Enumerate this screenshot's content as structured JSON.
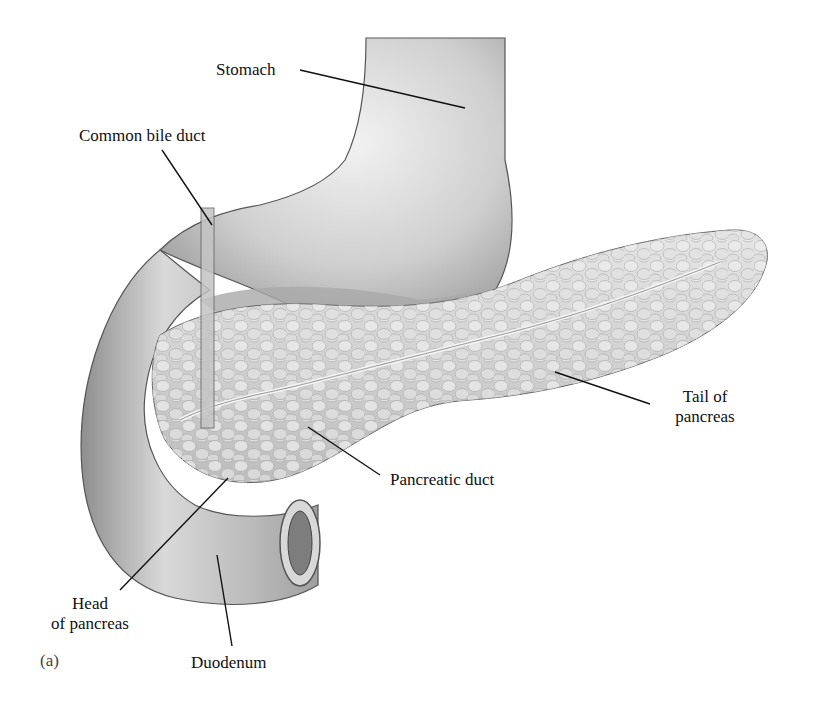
{
  "figure": {
    "panel_label": "(a)",
    "colors": {
      "organ_fill": "#c9c9c9",
      "organ_dark": "#9a9a9a",
      "outline": "#555555",
      "pancreas_fill": "#d6d6d6",
      "leader_line": "#111111",
      "background": "#ffffff"
    }
  },
  "labels": {
    "stomach": "Stomach",
    "common_bile_duct": "Common bile duct",
    "tail_of_pancreas_line1": "Tail of",
    "tail_of_pancreas_line2": "pancreas",
    "pancreatic_duct": "Pancreatic duct",
    "head_of_pancreas_line1": "Head",
    "head_of_pancreas_line2": "of pancreas",
    "duodenum": "Duodenum"
  }
}
